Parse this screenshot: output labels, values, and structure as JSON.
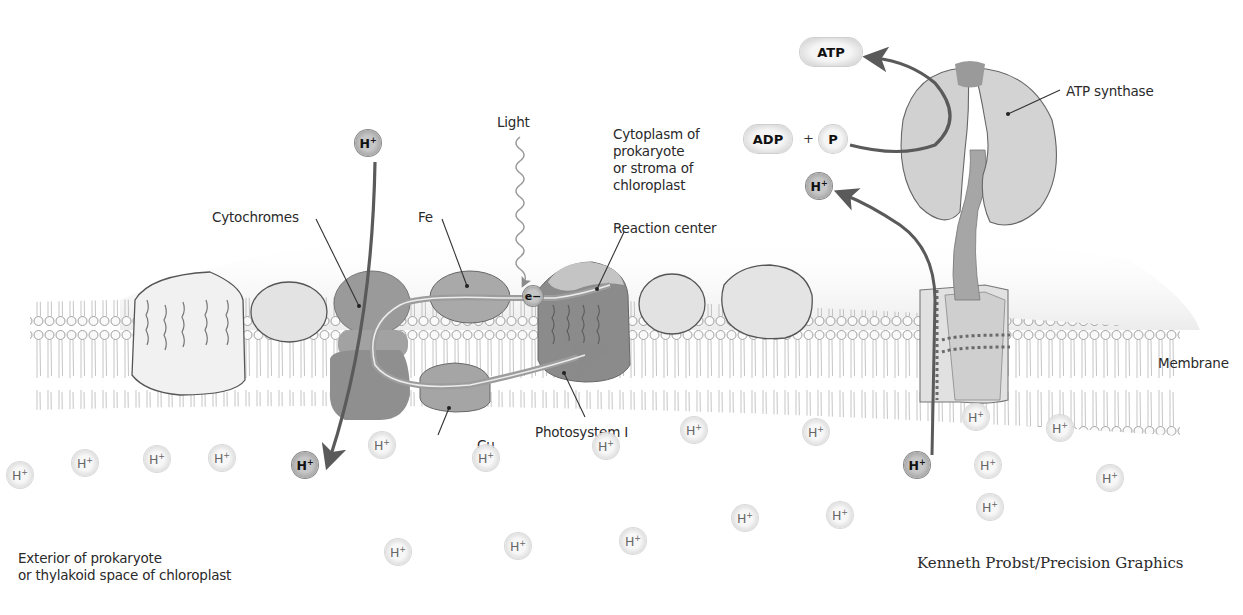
{
  "labels": {
    "light": "Light",
    "cytoplasm": "Cytoplasm of\nprokaryote\nor stroma of\nchloroplast",
    "cytochromes": "Cytochromes",
    "fe": "Fe",
    "reaction_center": "Reaction center",
    "cu": "Cu",
    "photosystem_i": "Photosystem I",
    "atp_synthase": "ATP synthase",
    "membrane": "Membrane",
    "exterior": "Exterior of prokaryote\nor thylakoid space of chloroplast",
    "credit": "Kenneth Probst/Precision Graphics"
  },
  "molecules": {
    "atp": "ATP",
    "adp": "ADP",
    "plus": "+",
    "p": "P",
    "electron": "e−"
  },
  "ions": {
    "symbol": "H",
    "charge": "+",
    "highlighted": [
      {
        "x": 368,
        "y": 143
      },
      {
        "x": 305,
        "y": 465
      },
      {
        "x": 819,
        "y": 186
      },
      {
        "x": 917,
        "y": 465
      }
    ],
    "background": [
      {
        "x": 20,
        "y": 475
      },
      {
        "x": 85,
        "y": 463
      },
      {
        "x": 157,
        "y": 459
      },
      {
        "x": 222,
        "y": 458
      },
      {
        "x": 382,
        "y": 445
      },
      {
        "x": 486,
        "y": 458
      },
      {
        "x": 606,
        "y": 446
      },
      {
        "x": 694,
        "y": 430
      },
      {
        "x": 816,
        "y": 432
      },
      {
        "x": 398,
        "y": 552
      },
      {
        "x": 518,
        "y": 546
      },
      {
        "x": 633,
        "y": 541
      },
      {
        "x": 745,
        "y": 518
      },
      {
        "x": 840,
        "y": 515
      },
      {
        "x": 976,
        "y": 417
      },
      {
        "x": 1060,
        "y": 428
      },
      {
        "x": 988,
        "y": 465
      },
      {
        "x": 1110,
        "y": 478
      },
      {
        "x": 990,
        "y": 507
      }
    ]
  },
  "colors": {
    "arrow": "#5a5a5a",
    "protein_dark": "#8e8e8e",
    "protein_light": "#d9d9d9",
    "outline": "#555555"
  }
}
